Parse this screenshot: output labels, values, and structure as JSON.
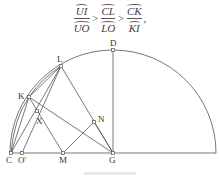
{
  "formula": {
    "terms": [
      {
        "numerator": "UI",
        "denominator": "UO"
      },
      {
        "numerator": "CL",
        "denominator": "LO"
      },
      {
        "numerator": "CK",
        "denominator": "KI"
      }
    ],
    "relation": ">",
    "terminator": ","
  },
  "figure": {
    "points": {
      "D": {
        "label": "D",
        "x": 113,
        "y": 50
      },
      "L": {
        "label": "L",
        "x": 61,
        "y": 66
      },
      "K": {
        "label": "K",
        "x": 29,
        "y": 97
      },
      "X": {
        "label": "X",
        "x": 37,
        "y": 111
      },
      "N": {
        "label": "N",
        "x": 94,
        "y": 122
      },
      "C": {
        "label": "C",
        "x": 11,
        "y": 153
      },
      "O'": {
        "label": "O'",
        "x": 22,
        "y": 153
      },
      "M": {
        "label": "M",
        "x": 63,
        "y": 153
      },
      "G": {
        "label": "G",
        "x": 113,
        "y": 153
      }
    },
    "stroke_color": "#555555"
  }
}
